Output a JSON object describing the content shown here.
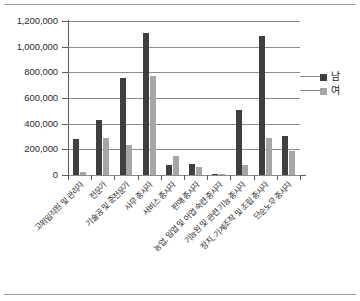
{
  "chart_data": {
    "type": "bar",
    "title": "",
    "xlabel": "",
    "ylabel": "",
    "ylim": [
      0,
      1200000
    ],
    "ytick_labels": [
      "1,200,000",
      "1,000,000",
      "800,000",
      "600,000",
      "400,000",
      "200,000",
      "0"
    ],
    "ytick_values": [
      1200000,
      1000000,
      800000,
      600000,
      400000,
      200000,
      0
    ],
    "grid": true,
    "legend_position": "right",
    "categories": [
      "고위임직원 및 관리자",
      "전문가",
      "기술공 및 준전문가",
      "사무 종사자",
      "서비스 종사자",
      "판매 종사자",
      "농업, 임업 및 어업 숙련 종사자",
      "기능원 및 관련 기능 종사자",
      "장치, 기계조작 및 조립 종사자",
      "단순노무 종사자"
    ],
    "series": [
      {
        "name": "남",
        "color": "#3f3f3f",
        "values": [
          280000,
          425000,
          755000,
          1110000,
          80000,
          85000,
          10000,
          510000,
          1085000,
          305000
        ]
      },
      {
        "name": "여",
        "color": "#a6a6a6",
        "values": [
          20000,
          290000,
          230000,
          775000,
          145000,
          60000,
          8000,
          78000,
          285000,
          185000
        ]
      }
    ]
  },
  "legend": {
    "items": [
      {
        "label": "남",
        "color": "#3f3f3f"
      },
      {
        "label": "여",
        "color": "#a6a6a6"
      }
    ]
  }
}
